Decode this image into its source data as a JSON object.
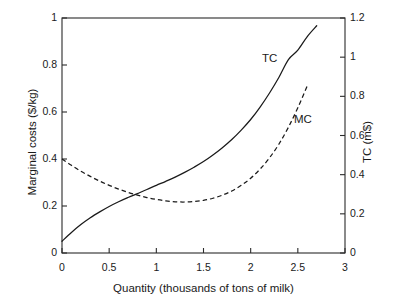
{
  "chart_data": {
    "type": "line",
    "title": "",
    "xlabel": "Quantity (thousands of tons of milk)",
    "ylabel": "Marginal costs ($/kg)",
    "ylabel_right": "TC (m$)",
    "xlim": [
      0,
      3
    ],
    "ylim": [
      0,
      1
    ],
    "ylim_right": [
      0,
      1.2
    ],
    "grid": false,
    "legend": "inline-annotations",
    "xticks": [
      "0",
      "0.5",
      "1",
      "1.5",
      "2",
      "2.5",
      "3"
    ],
    "xtick_values": [
      0,
      0.5,
      1,
      1.5,
      2,
      2.5,
      3
    ],
    "yticks_left": [
      "0",
      "0.2",
      "0.4",
      "0.6",
      "0.8",
      "1"
    ],
    "ytick_values_left": [
      0,
      0.2,
      0.4,
      0.6,
      0.8,
      1
    ],
    "yticks_right": [
      "0",
      "0.2",
      "0.4",
      "0.6",
      "0.8",
      "1",
      "1.2"
    ],
    "ytick_values_right": [
      0,
      0.2,
      0.4,
      0.6,
      0.8,
      1,
      1.2
    ],
    "annotations": [
      {
        "text": "TC",
        "x": 2.18,
        "y": 0.8
      },
      {
        "text": "MC",
        "x": 2.52,
        "y": 0.545
      }
    ],
    "series": [
      {
        "name": "TC",
        "label": "TC",
        "axis": "right",
        "style": "solid",
        "color": "#1a1a1a",
        "x": [
          0.0,
          0.1,
          0.2,
          0.3,
          0.4,
          0.5,
          0.6,
          0.7,
          0.8,
          0.9,
          1.0,
          1.1,
          1.2,
          1.3,
          1.4,
          1.5,
          1.6,
          1.7,
          1.8,
          1.9,
          2.0,
          2.1,
          2.2,
          2.3,
          2.4,
          2.5,
          2.6,
          2.7
        ],
        "values_right_axis": [
          0.06,
          0.105,
          0.145,
          0.18,
          0.21,
          0.237,
          0.261,
          0.283,
          0.304,
          0.324,
          0.345,
          0.366,
          0.388,
          0.412,
          0.438,
          0.467,
          0.5,
          0.537,
          0.579,
          0.627,
          0.682,
          0.745,
          0.817,
          0.898,
          0.988,
          1.036,
          1.105,
          1.16
        ],
        "values_left_axis": [
          0.05,
          0.0875,
          0.121,
          0.15,
          0.175,
          0.198,
          0.218,
          0.236,
          0.253,
          0.27,
          0.288,
          0.305,
          0.323,
          0.343,
          0.365,
          0.389,
          0.417,
          0.448,
          0.483,
          0.523,
          0.568,
          0.621,
          0.681,
          0.748,
          0.823,
          0.863,
          0.921,
          0.967
        ]
      },
      {
        "name": "MC",
        "label": "MC",
        "axis": "left",
        "style": "dashed",
        "color": "#1a1a1a",
        "x": [
          0.0,
          0.1,
          0.2,
          0.3,
          0.4,
          0.5,
          0.6,
          0.7,
          0.8,
          0.9,
          1.0,
          1.1,
          1.2,
          1.3,
          1.4,
          1.5,
          1.6,
          1.7,
          1.8,
          1.9,
          2.0,
          2.1,
          2.2,
          2.3,
          2.4,
          2.5,
          2.6
        ],
        "values_left_axis": [
          0.4,
          0.373,
          0.348,
          0.326,
          0.306,
          0.288,
          0.272,
          0.258,
          0.246,
          0.236,
          0.228,
          0.222,
          0.218,
          0.217,
          0.219,
          0.224,
          0.233,
          0.246,
          0.264,
          0.288,
          0.318,
          0.357,
          0.405,
          0.464,
          0.535,
          0.618,
          0.712
        ]
      }
    ]
  },
  "labels": {
    "xlabel": "Quantity (thousands of tons of milk)",
    "ylabel_left": "Marginal costs ($/kg)",
    "ylabel_right": "TC (m$)",
    "tc": "TC",
    "mc": "MC"
  }
}
